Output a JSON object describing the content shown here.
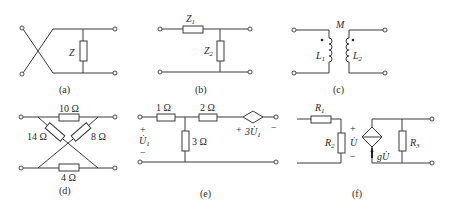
{
  "figure": {
    "panels": [
      {
        "id": "a",
        "caption": "(a)",
        "elements": [
          {
            "type": "resistor",
            "label": "Z"
          }
        ],
        "description": "crossed input leads feeding a shunt impedance Z"
      },
      {
        "id": "b",
        "caption": "(b)",
        "elements": [
          {
            "type": "resistor",
            "label": "Z",
            "sub": "1"
          },
          {
            "type": "resistor",
            "label": "Z",
            "sub": "2"
          }
        ],
        "description": "series Z1, shunt Z2 (L-network)"
      },
      {
        "id": "c",
        "caption": "(c)",
        "elements": [
          {
            "type": "inductor",
            "label": "L",
            "sub": "1"
          },
          {
            "type": "inductor",
            "label": "L",
            "sub": "2"
          },
          {
            "type": "mutual",
            "label": "M"
          }
        ],
        "description": "coupled inductors with dot markings"
      },
      {
        "id": "d",
        "caption": "(d)",
        "elements": [
          {
            "type": "resistor",
            "label": "10 Ω"
          },
          {
            "type": "resistor",
            "label": "14 Ω"
          },
          {
            "type": "resistor",
            "label": "8 Ω"
          },
          {
            "type": "resistor",
            "label": "4 Ω"
          }
        ],
        "description": "lattice network"
      },
      {
        "id": "e",
        "caption": "(e)",
        "elements": [
          {
            "type": "resistor",
            "label": "1 Ω"
          },
          {
            "type": "resistor",
            "label": "2 Ω"
          },
          {
            "type": "resistor",
            "label": "3 Ω"
          },
          {
            "type": "dependent-voltage-source",
            "label": "3U̇",
            "sub": "1"
          },
          {
            "type": "port-voltage",
            "label": "U̇",
            "sub": "1"
          }
        ],
        "description": "T network with dependent voltage source"
      },
      {
        "id": "f",
        "caption": "(f)",
        "elements": [
          {
            "type": "resistor",
            "label": "R",
            "sub": "1"
          },
          {
            "type": "resistor",
            "label": "R",
            "sub": "2"
          },
          {
            "type": "resistor",
            "label": "R",
            "sub": "3"
          },
          {
            "type": "dependent-current-source",
            "label": "gU̇"
          },
          {
            "type": "control-voltage",
            "label": "U̇"
          }
        ],
        "description": "VCCS two-port"
      }
    ]
  },
  "labels": {
    "a_z": "Z",
    "b_z1": "Z",
    "b_z1_sub": "1",
    "b_z2": "Z",
    "b_z2_sub": "2",
    "c_m": "M",
    "c_l1": "L",
    "c_l1_sub": "1",
    "c_l2": "L",
    "c_l2_sub": "2",
    "d_10": "10 Ω",
    "d_14": "14 Ω",
    "d_8": "8 Ω",
    "d_4": "4 Ω",
    "e_1": "1 Ω",
    "e_2": "2 Ω",
    "e_3": "3 Ω",
    "e_plus": "+",
    "e_minus": "−",
    "e_u": "U̇",
    "e_u_sub": "1",
    "e_src_plus": "+",
    "e_src_minus": "−",
    "e_src": "3U̇",
    "e_src_sub": "1",
    "f_r1": "R",
    "f_r1_sub": "1",
    "f_r2": "R",
    "f_r2_sub": "2",
    "f_r3": "R",
    "f_r3_sub": "3",
    "f_plus": "+",
    "f_minus": "−",
    "f_u": "U̇",
    "f_src": "gU̇"
  },
  "captions": {
    "a": "(a)",
    "b": "(b)",
    "c": "(c)",
    "d": "(d)",
    "e": "(e)",
    "f": "(f)"
  }
}
